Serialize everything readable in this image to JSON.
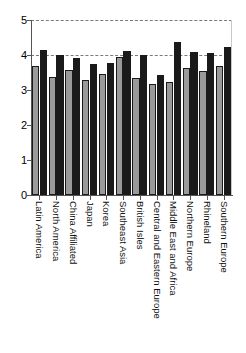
{
  "chart_data": {
    "type": "bar",
    "title": "",
    "subtitle": "",
    "xlabel": "",
    "ylabel": "",
    "ylim": [
      0,
      5
    ],
    "yticks": [
      0,
      1,
      2,
      3,
      4,
      5
    ],
    "ytick_labels": [
      "0",
      "1",
      "2",
      "3",
      "4",
      "5"
    ],
    "grid": true,
    "gridlines_at": [
      4,
      5
    ],
    "legend": [],
    "legend_position": "none",
    "orientation": "vertical",
    "grouped": true,
    "categories": [
      "Latin America",
      "North America",
      "China Affiliated",
      "Japan",
      "Korea",
      "Southeast Asia",
      "British Isles",
      "Central and Eastern Europe",
      "Middle East and Africa",
      "Northern Europe",
      "Rhineland",
      "Southern Europe"
    ],
    "series": [
      {
        "name": "series-1",
        "color": "#9a9a9a",
        "values": [
          3.7,
          3.36,
          3.58,
          3.28,
          3.45,
          3.93,
          3.33,
          3.18,
          3.22,
          3.64,
          3.53,
          3.7
        ]
      },
      {
        "name": "series-2",
        "color": "#1a1a1a",
        "values": [
          4.13,
          3.99,
          3.91,
          3.73,
          3.76,
          4.12,
          4.0,
          3.43,
          4.38,
          4.1,
          4.07,
          4.22
        ]
      }
    ]
  },
  "axis": {
    "y_max_label": "5",
    "y_min_label": "0"
  }
}
